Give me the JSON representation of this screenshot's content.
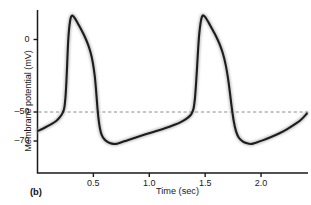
{
  "figure": {
    "panel_label": "(b)",
    "background": "#ffffff",
    "axis_color": "#1a1a1a",
    "trace_color": "#1d1d1d",
    "trace_halo_color": "#9a9a9a",
    "threshold_line_color": "#8c8c8c"
  },
  "chart_data": {
    "type": "line",
    "title": "",
    "subtitle": "",
    "xlabel": "Time (sec)",
    "ylabel": "Membrane potential (mV)",
    "xlim": [
      0.0,
      2.42
    ],
    "ylim": [
      -78,
      22
    ],
    "xticks": [
      0.5,
      1.0,
      1.5,
      2.0
    ],
    "xtick_labels": [
      "0.5",
      "1.0",
      "1.5",
      "2.0"
    ],
    "yticks": [
      0,
      -50,
      -70
    ],
    "ytick_labels": [
      "0",
      "-50",
      "-70"
    ],
    "grid": false,
    "legend": null,
    "annotations": [
      {
        "name": "threshold-line",
        "type": "hline",
        "y": -50,
        "style": "dashed",
        "color": "#8c8c8c",
        "label": ""
      }
    ],
    "series": [
      {
        "name": "membrane potential",
        "color": "#1d1d1d",
        "points": [
          [
            0.005,
            -63.0
          ],
          [
            0.06,
            -61.0
          ],
          [
            0.12,
            -58.6
          ],
          [
            0.17,
            -56.0
          ],
          [
            0.2,
            -53.6
          ],
          [
            0.225,
            -50.6
          ],
          [
            0.24,
            -47.0
          ],
          [
            0.25,
            -40.0
          ],
          [
            0.258,
            -30.0
          ],
          [
            0.265,
            -18.0
          ],
          [
            0.272,
            -5.0
          ],
          [
            0.28,
            5.0
          ],
          [
            0.29,
            12.0
          ],
          [
            0.3,
            15.6
          ],
          [
            0.315,
            16.4
          ],
          [
            0.335,
            14.6
          ],
          [
            0.36,
            11.2
          ],
          [
            0.39,
            7.0
          ],
          [
            0.42,
            2.4
          ],
          [
            0.45,
            -3.0
          ],
          [
            0.475,
            -9.0
          ],
          [
            0.495,
            -16.0
          ],
          [
            0.512,
            -25.0
          ],
          [
            0.524,
            -35.0
          ],
          [
            0.534,
            -45.0
          ],
          [
            0.545,
            -54.0
          ],
          [
            0.558,
            -61.0
          ],
          [
            0.575,
            -66.0
          ],
          [
            0.6,
            -69.0
          ],
          [
            0.63,
            -70.8
          ],
          [
            0.665,
            -71.8
          ],
          [
            0.7,
            -72.0
          ],
          [
            0.745,
            -71.0
          ],
          [
            0.8,
            -69.6
          ],
          [
            0.88,
            -67.6
          ],
          [
            0.96,
            -65.6
          ],
          [
            1.05,
            -63.4
          ],
          [
            1.14,
            -61.2
          ],
          [
            1.22,
            -59.0
          ],
          [
            1.29,
            -56.6
          ],
          [
            1.34,
            -54.2
          ],
          [
            1.375,
            -51.6
          ],
          [
            1.395,
            -48.0
          ],
          [
            1.408,
            -41.0
          ],
          [
            1.418,
            -31.0
          ],
          [
            1.427,
            -20.0
          ],
          [
            1.436,
            -8.0
          ],
          [
            1.446,
            3.0
          ],
          [
            1.458,
            11.0
          ],
          [
            1.47,
            15.4
          ],
          [
            1.485,
            16.6
          ],
          [
            1.505,
            15.0
          ],
          [
            1.53,
            11.8
          ],
          [
            1.56,
            7.6
          ],
          [
            1.595,
            2.6
          ],
          [
            1.63,
            -3.4
          ],
          [
            1.66,
            -10.0
          ],
          [
            1.685,
            -18.0
          ],
          [
            1.705,
            -27.0
          ],
          [
            1.722,
            -37.0
          ],
          [
            1.738,
            -47.0
          ],
          [
            1.755,
            -56.0
          ],
          [
            1.775,
            -63.0
          ],
          [
            1.8,
            -67.6
          ],
          [
            1.835,
            -70.2
          ],
          [
            1.875,
            -71.6
          ],
          [
            1.915,
            -72.0
          ],
          [
            1.96,
            -71.0
          ],
          [
            2.02,
            -69.4
          ],
          [
            2.09,
            -67.2
          ],
          [
            2.16,
            -64.8
          ],
          [
            2.23,
            -62.0
          ],
          [
            2.3,
            -58.6
          ],
          [
            2.36,
            -55.2
          ],
          [
            2.41,
            -51.0
          ]
        ]
      }
    ]
  }
}
